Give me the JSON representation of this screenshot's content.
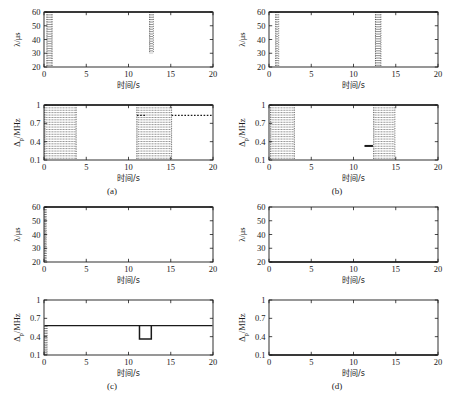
{
  "figure": {
    "type": "multi-panel-line-chart",
    "background": "#ffffff",
    "line_color": "#1a1a1a",
    "grid": false,
    "panels_layout": "2x2",
    "panel_labels": [
      "(a)",
      "(b)",
      "(c)",
      "(d)"
    ]
  },
  "axes_text": {
    "xlabel": "时间/s",
    "ylabel_top": "λ/μs",
    "ylabel_bottom": "Δₚ/MHz",
    "ylabel_bottom_base": "Δ",
    "ylabel_bottom_sub": "p",
    "ylabel_bottom_unit": "/MHz",
    "xticks": [
      "0",
      "5",
      "10",
      "15",
      "20"
    ],
    "yticks_top": [
      "20",
      "30",
      "40",
      "50",
      "60"
    ],
    "yticks_bottom": [
      "0.1",
      "0.4",
      "0.7",
      "1"
    ]
  },
  "chart_data": {
    "type": "line",
    "title": "",
    "xlabel": "时间/s",
    "shared_xlim": [
      0,
      20
    ],
    "xticks": [
      0,
      5,
      10,
      15,
      20
    ],
    "panels": [
      {
        "label": "(a)",
        "subplots": [
          {
            "name": "lambda-a",
            "ylabel": "λ/μs",
            "ylim": [
              20,
              60
            ],
            "yticks": [
              20,
              30,
              40,
              50,
              60
            ],
            "style": "dotted",
            "description": "Flat at 60 with two downward dotted excursions",
            "baseline": 60,
            "events": [
              {
                "t_start": 0.35,
                "t_end": 0.95,
                "min_value": 20,
                "kind": "dotted-vertical-band"
              },
              {
                "t_start": 12.5,
                "t_end": 12.95,
                "min_value": 30,
                "kind": "dotted-vertical-band"
              }
            ]
          },
          {
            "name": "delta-a",
            "ylabel": "Δp/MHz",
            "ylim": [
              0.1,
              1.0
            ],
            "yticks": [
              0.1,
              0.4,
              0.7,
              1.0
            ],
            "style": "dotted",
            "baseline": 1.0,
            "events": [
              {
                "t_start": 0.1,
                "t_end": 3.8,
                "min_value": 0.1,
                "kind": "dense-dotted-verticals"
              },
              {
                "t_start": 11.0,
                "t_end": 15.1,
                "min_value": 0.1,
                "kind": "dense-dotted-verticals"
              },
              {
                "t_start": 11.0,
                "t_end": 12.0,
                "level": 0.83,
                "kind": "dotted-horizontal"
              },
              {
                "t_start": 15.1,
                "t_end": 20.0,
                "level": 0.83,
                "kind": "dotted-horizontal"
              }
            ]
          }
        ]
      },
      {
        "label": "(b)",
        "subplots": [
          {
            "name": "lambda-b",
            "ylabel": "λ/μs",
            "ylim": [
              20,
              60
            ],
            "yticks": [
              20,
              30,
              40,
              50,
              60
            ],
            "style": "dotted",
            "baseline": 60,
            "events": [
              {
                "t_start": 0.8,
                "t_end": 1.15,
                "min_value": 20,
                "kind": "dotted-vertical-band"
              },
              {
                "t_start": 12.6,
                "t_end": 13.25,
                "min_value": 20,
                "kind": "dotted-vertical-band"
              }
            ]
          },
          {
            "name": "delta-b",
            "ylabel": "Δp/MHz",
            "ylim": [
              0.1,
              1.0
            ],
            "yticks": [
              0.1,
              0.4,
              0.7,
              1.0
            ],
            "style": "dotted",
            "baseline": 1.0,
            "events": [
              {
                "t_start": 0.2,
                "t_end": 3.0,
                "min_value": 0.1,
                "kind": "dense-dotted-verticals"
              },
              {
                "t_start": 12.4,
                "t_end": 14.9,
                "min_value": 0.1,
                "kind": "dense-dotted-verticals"
              },
              {
                "t_start": 11.3,
                "t_end": 12.3,
                "level": 0.33,
                "kind": "solid-horizontal-segment"
              }
            ]
          }
        ]
      },
      {
        "label": "(c)",
        "subplots": [
          {
            "name": "lambda-c",
            "ylabel": "λ/μs",
            "ylim": [
              20,
              60
            ],
            "yticks": [
              20,
              30,
              40,
              50,
              60
            ],
            "style": "solid",
            "baseline": 60,
            "events": [
              {
                "t_start": 0.1,
                "t_end": 0.25,
                "min_value": 20,
                "kind": "dotted-vertical-band"
              }
            ]
          },
          {
            "name": "delta-c",
            "ylabel": "Δp/MHz",
            "ylim": [
              0.1,
              1.0
            ],
            "yticks": [
              0.1,
              0.4,
              0.7,
              1.0
            ],
            "style": "solid",
            "baseline": 0.58,
            "events": [
              {
                "t_start": 0.1,
                "t_end": 0.35,
                "min_value": 0.1,
                "kind": "dotted-vertical-band"
              },
              {
                "t_start": 11.3,
                "t_end": 12.7,
                "level": 0.36,
                "kind": "step-down"
              }
            ]
          }
        ]
      },
      {
        "label": "(d)",
        "subplots": [
          {
            "name": "lambda-d",
            "ylabel": "λ/μs",
            "ylim": [
              20,
              60
            ],
            "yticks": [
              20,
              30,
              40,
              50,
              60
            ],
            "style": "solid",
            "baseline": 20,
            "events": []
          },
          {
            "name": "delta-d",
            "ylabel": "Δp/MHz",
            "ylim": [
              0.1,
              1.0
            ],
            "yticks": [
              0.1,
              0.4,
              0.7,
              1.0
            ],
            "style": "solid",
            "baseline": 0.1,
            "events": []
          }
        ]
      }
    ]
  }
}
